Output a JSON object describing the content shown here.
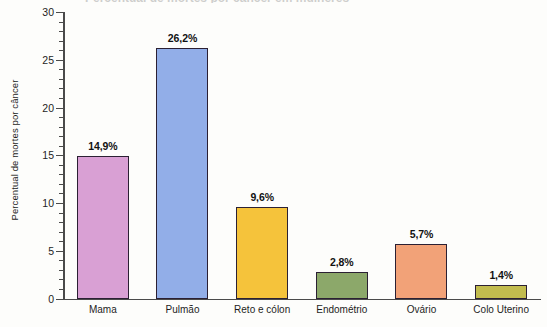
{
  "title_sliver": "Percentual de mortes por câncer em mulheres",
  "chart_data": {
    "type": "bar",
    "title": "",
    "xlabel": "",
    "ylabel": "Percentual de mortes por câncer",
    "ylim": [
      0,
      30
    ],
    "ytick_step": 5,
    "yminor_step": 1,
    "grid": false,
    "legend": "none",
    "value_suffix": "%",
    "decimal_separator": ",",
    "categories": [
      "Mama",
      "Pulmão",
      "Reto e cólon",
      "Endométrio",
      "Ovário",
      "Colo Uterino"
    ],
    "values": [
      14.9,
      26.2,
      9.6,
      2.8,
      5.7,
      1.4
    ],
    "value_labels": [
      "14,9%",
      "26,2%",
      "9,6%",
      "2,8%",
      "5,7%",
      "1,4%"
    ],
    "colors": [
      "#d9a0d4",
      "#92aee8",
      "#f5c33b",
      "#8ca86a",
      "#f2a278",
      "#c2bc4e"
    ],
    "bar_outline_color": "#2b2033",
    "ytick_labels": [
      "0",
      "5",
      "10",
      "15",
      "20",
      "25",
      "30"
    ],
    "ytick_values": [
      0,
      5,
      10,
      15,
      20,
      25,
      30
    ]
  }
}
